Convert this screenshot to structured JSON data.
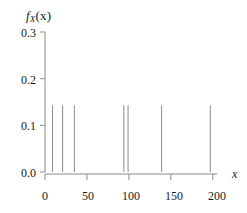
{
  "chart_data": {
    "type": "bar",
    "title": "",
    "subtitle": "",
    "xlabel": "x",
    "ylabel": "f_X(x)",
    "ylabel_parts": {
      "f": "f",
      "sub": "X",
      "arg": "(x)"
    },
    "x": [
      9,
      21,
      35,
      94,
      99,
      139,
      197
    ],
    "values": [
      0.143,
      0.143,
      0.143,
      0.143,
      0.143,
      0.143,
      0.143
    ],
    "xlim": [
      0,
      205
    ],
    "ylim": [
      0.0,
      0.3
    ],
    "xticks": [
      0,
      50,
      100,
      150,
      200
    ],
    "xtick_labels": [
      "0",
      "50",
      "100",
      "150",
      "200"
    ],
    "yticks": [
      0.0,
      0.1,
      0.2,
      0.3
    ],
    "ytick_labels": [
      "0.0",
      "0.1",
      "0.2",
      "0.3"
    ],
    "grid": false,
    "legend": null,
    "annotations": [],
    "line_color": "#8a8a8a",
    "axis_color": "#8a8a8a",
    "text_color": "#1a1a1a",
    "background": "#ffffff"
  },
  "axes": {
    "y_tick_0": "0.0",
    "y_tick_1": "0.1",
    "y_tick_2": "0.2",
    "y_tick_3": "0.3",
    "x_tick_0": "0",
    "x_tick_1": "50",
    "x_tick_2": "100",
    "x_tick_3": "150",
    "x_tick_4": "200"
  }
}
